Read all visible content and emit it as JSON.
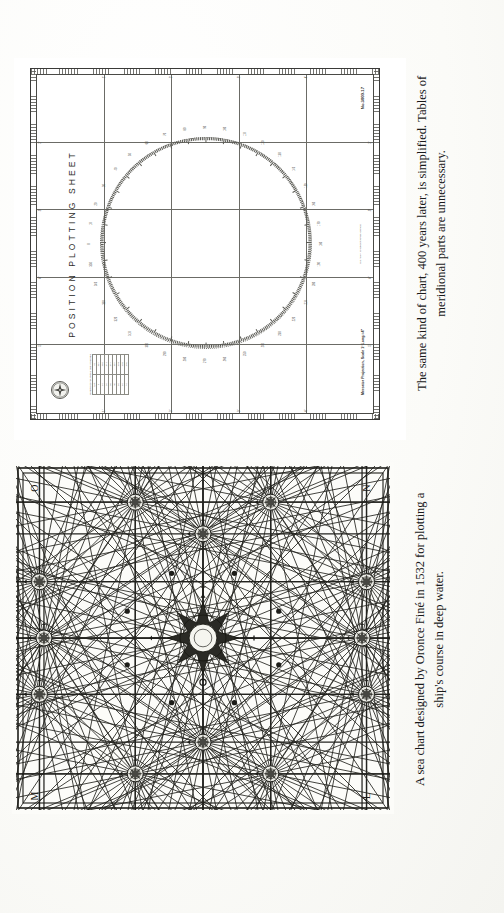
{
  "page": {
    "background_color": "#fdfdfb",
    "ink_color": "#19191a",
    "orientation": "landscape-rotated-90"
  },
  "figures": [
    {
      "id": "position-plotting-sheet",
      "type": "nautical-plotting-sheet",
      "title": "POSITION  PLOTTING  SHEET",
      "sheet_number": "No.3000-17",
      "projection_note": "Mercator Projection, Scale 1° Long.=4\"",
      "publisher_note": "U.S. NAVY HYDROGRAPHIC OFFICE",
      "corner_emblem": "compass-rose-emblem",
      "edge_labels": {
        "top": [
          "5'",
          "4'",
          "3'",
          "2'",
          "1'"
        ],
        "bottom": [
          "5'",
          "4'",
          "3'",
          "2'",
          "1'"
        ],
        "left": [
          "1'",
          "2'",
          "3'",
          "4'"
        ],
        "right": [
          "1'",
          "2'",
          "3'",
          "4'"
        ]
      },
      "table": {
        "caption": "LENGTH OF NAUTICAL MILE IN INCHES",
        "headers": [
          "LAT.",
          "IN."
        ],
        "rows": [
          [
            "0",
            ".067"
          ],
          [
            "10",
            ".068"
          ],
          [
            "20",
            ".071"
          ],
          [
            "30",
            ".077"
          ],
          [
            "40",
            ".087"
          ],
          [
            "50",
            ".104"
          ],
          [
            "60",
            ".133"
          ],
          [
            "70",
            ".195"
          ]
        ]
      },
      "compass_scale": {
        "type": "degree-circle",
        "tick_interval_degrees": 1,
        "label_interval_degrees": 10,
        "labels": [
          "0",
          "10",
          "20",
          "30",
          "40",
          "50",
          "60",
          "70",
          "80",
          "90",
          "100",
          "110",
          "120",
          "130",
          "140",
          "150",
          "160",
          "170",
          "180",
          "190",
          "200",
          "210",
          "220",
          "230",
          "240",
          "250",
          "260",
          "270",
          "280",
          "290",
          "300",
          "310",
          "320",
          "330",
          "340",
          "350"
        ]
      },
      "grid": {
        "vertical_lines": 4,
        "horizontal_lines": 4
      }
    },
    {
      "id": "oronce-fine-sea-chart",
      "type": "rhumb-line-sea-chart",
      "corner_letters": {
        "top_left": "O",
        "top_right": "N",
        "bottom_left": "M",
        "bottom_right": "L"
      },
      "compass_roses": 13,
      "rhumb_directions_per_rose": 32,
      "description": "network of rhumb lines radiating from compass roses"
    }
  ],
  "captions": {
    "top": {
      "line1": "The same kind of chart, 400 years later, is simplified. Tables of",
      "line2": "meridional parts are unnecessary."
    },
    "bottom": {
      "line1": "A sea chart designed by Oronce Finé in 1532 for plotting a",
      "line2": "ship's course in deep water."
    }
  },
  "chart_data": {
    "type": "table",
    "title": "LENGTH OF NAUTICAL MILE IN INCHES",
    "categories": [
      "0",
      "10",
      "20",
      "30",
      "40",
      "50",
      "60",
      "70"
    ],
    "values": [
      0.067,
      0.068,
      0.071,
      0.077,
      0.087,
      0.104,
      0.133,
      0.195
    ],
    "xlabel": "LAT.",
    "ylabel": "IN.",
    "ylim": [
      0,
      0.2
    ],
    "grid": true,
    "legend": "none"
  }
}
